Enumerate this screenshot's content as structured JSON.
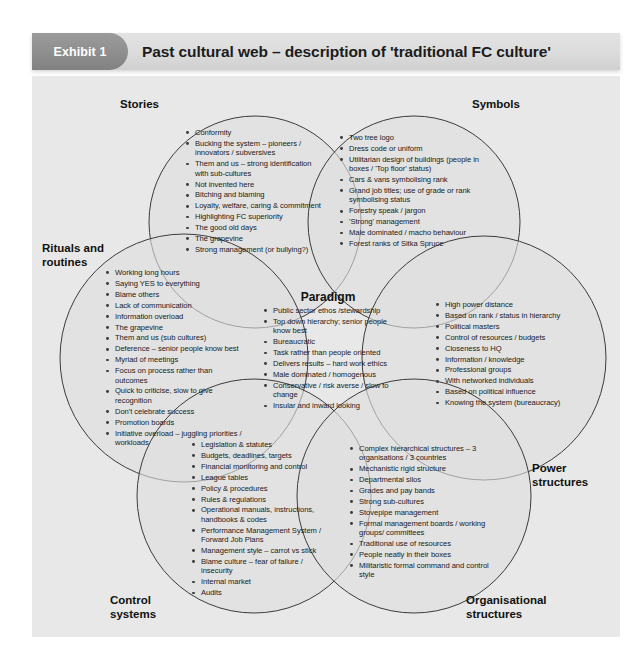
{
  "header": {
    "badge": "Exhibit 1",
    "title": "Past cultural web – description of 'traditional FC culture'"
  },
  "colors": {
    "panel_background": "#e8e8e8",
    "circle_fill": "#dedede",
    "circle_stroke": "#3c3c3c",
    "badge_background": "#8e8e8e",
    "header_background": "#dcdcdc",
    "text": "#1a1a1a"
  },
  "paradigm": {
    "title": "Paradigm",
    "items": [
      "Public sector ethos /stewardship",
      "Top down hierarchy; senior people know best",
      "Bureaucratic",
      "Task rather than people oriented",
      "Delivers results – hard work ethics",
      "Male dominated / homogenous",
      "Conservative / risk averse / slow to change",
      "Insular and inward looking"
    ]
  },
  "sections": [
    {
      "id": "stories",
      "label": "Stories",
      "items": [
        "Conformity",
        "Bucking the system – pioneers / innovators / subversives",
        "Them and us – strong identification with sub-cultures",
        "Not invented here",
        "Bitching and blaming",
        "Loyalty, welfare, caring & commitment",
        "Highlighting FC superiority",
        "The good old days",
        "The grapevine",
        "Strong management (or bullying?)"
      ]
    },
    {
      "id": "symbols",
      "label": "Symbols",
      "items": [
        "Two tree logo",
        "Dress code or uniform",
        "Utilitarian design of buildings (people in boxes / 'Top floor' status)",
        "Cars & vans symbolising rank",
        "Grand job titles; use of grade or rank symbolising status",
        "Forestry speak / jargon",
        "'Strong' management",
        "Male dominated / macho behaviour",
        "Forest ranks of Sitka Spruce"
      ]
    },
    {
      "id": "rituals-and-routines",
      "label": "Rituals and\nroutines",
      "items": [
        "Working long hours",
        "Saying YES to everything",
        "Blame others",
        "Lack of communication",
        "Information overload",
        "The grapevine",
        "Them and us (sub cultures)",
        "Deference – senior people know best",
        "Myriad of meetings",
        "Focus on process rather than outcomes",
        "Quick to criticise, slow to give recognition",
        "Don't celebrate success",
        "Promotion boards",
        "Initiative overload – juggling priorities / workloads"
      ]
    },
    {
      "id": "power-structures",
      "label": "Power\nstructures",
      "items": [
        "High power distance",
        "Based on rank / status in hierarchy",
        "Political masters",
        "Control of resources / budgets",
        "Closeness to HQ",
        "Information / knowledge",
        "Professional groups",
        "With networked individuals",
        "Based on political influence",
        "Knowing the system (bureaucracy)"
      ]
    },
    {
      "id": "control-systems",
      "label": "Control\nsystems",
      "items": [
        "Legislation & statutes",
        "Budgets, deadlines, targets",
        "Financial monitoring and control",
        "League tables",
        "Policy & procedures",
        "Rules & regulations",
        "Operational manuals, instructions, handbooks & codes",
        "Performance Management System / Forward Job Plans",
        "Management style – carrot vs stick",
        "Blame culture – fear of failure / insecurity",
        "Internal market",
        "Audits"
      ]
    },
    {
      "id": "organisational-structures",
      "label": "Organisational\nstructures",
      "items": [
        "Complex hierarchical structures – 3 organisations / 3 countries",
        "Mechanistic rigid structure",
        "Departmental silos",
        "Grades and pay bands",
        "Strong sub-cultures",
        "Stovepipe management",
        "Formal management boards / working groups/ committees",
        "Traditional use of resources",
        "People neatly in their boxes",
        "Militaristic formal command and control style"
      ]
    }
  ]
}
